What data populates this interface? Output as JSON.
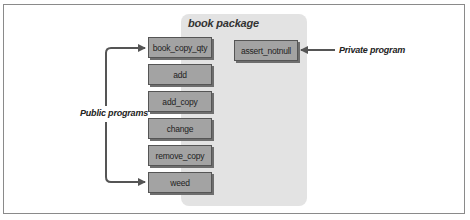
{
  "diagram": {
    "package_title": "book package",
    "public_programs": [
      {
        "name": "book_copy_qty"
      },
      {
        "name": "add"
      },
      {
        "name": "add_copy"
      },
      {
        "name": "change"
      },
      {
        "name": "remove_copy"
      },
      {
        "name": "weed"
      }
    ],
    "private_programs": [
      {
        "name": "assert_notnull"
      }
    ],
    "labels": {
      "public": "Public programs",
      "private": "Private program"
    },
    "colors": {
      "package_bg": "#e3e3e3",
      "box_fill": "#a3a3a3",
      "arrow": "#555555"
    }
  }
}
